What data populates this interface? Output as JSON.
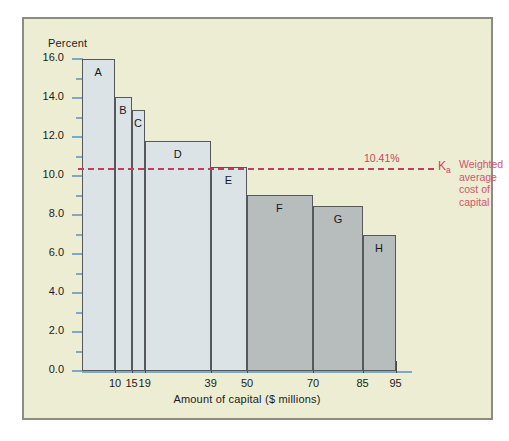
{
  "figure": {
    "y_axis_title": "Percent",
    "x_axis_title": "Amount of capital ($ millions)"
  },
  "annotation": {
    "value_label": "10.41%",
    "symbol": "K",
    "symbol_sub": "a",
    "description_lines": [
      "Weighted",
      "average",
      "cost of",
      "capital"
    ],
    "color": "#cf4263"
  },
  "colors": {
    "plate_background": "#ecedd2",
    "plate_border": "#8b8c84",
    "axis": "#7ea8c4",
    "bar_light": "#dbe3e6",
    "bar_dark": "#b7bcbd",
    "bar_outline": "#55595b",
    "wacc_line": "#c8395c",
    "text": "#1c1c1c"
  },
  "chart_data": {
    "type": "bar",
    "title": "",
    "xlabel": "Amount of capital ($ millions)",
    "ylabel": "Percent",
    "xlim": [
      0,
      100
    ],
    "ylim": [
      0.0,
      16.0
    ],
    "grid": false,
    "legend": "none",
    "ytick_labels": [
      "0.0",
      "2.0",
      "4.0",
      "6.0",
      "8.0",
      "10.0",
      "12.0",
      "14.0",
      "16.0"
    ],
    "ytick_values": [
      0.0,
      2.0,
      4.0,
      6.0,
      8.0,
      10.0,
      12.0,
      14.0,
      16.0
    ],
    "yminor_values": [
      1.0,
      3.0,
      5.0,
      7.0,
      9.0,
      11.0,
      13.0,
      15.0
    ],
    "xtick_labels": [
      "10",
      "15",
      "19",
      "39",
      "50",
      "70",
      "85",
      "95"
    ],
    "xtick_values": [
      10,
      15,
      19,
      39,
      50,
      70,
      85,
      95
    ],
    "categories": [
      "A",
      "B",
      "C",
      "D",
      "E",
      "F",
      "G",
      "H"
    ],
    "values": [
      16.0,
      14.05,
      13.4,
      11.8,
      10.45,
      9.05,
      8.45,
      7.0
    ],
    "bar_edges": [
      {
        "label": "A",
        "x_start": 0,
        "x_end": 10,
        "value": 16.0,
        "shade": "light"
      },
      {
        "label": "B",
        "x_start": 10,
        "x_end": 15,
        "value": 14.05,
        "shade": "light"
      },
      {
        "label": "C",
        "x_start": 15,
        "x_end": 19,
        "value": 13.4,
        "shade": "light"
      },
      {
        "label": "D",
        "x_start": 19,
        "x_end": 39,
        "value": 11.8,
        "shade": "light"
      },
      {
        "label": "E",
        "x_start": 39,
        "x_end": 50,
        "value": 10.45,
        "shade": "light"
      },
      {
        "label": "F",
        "x_start": 50,
        "x_end": 70,
        "value": 9.05,
        "shade": "dark"
      },
      {
        "label": "G",
        "x_start": 70,
        "x_end": 85,
        "value": 8.45,
        "shade": "dark"
      },
      {
        "label": "H",
        "x_start": 85,
        "x_end": 95,
        "value": 7.0,
        "shade": "dark"
      }
    ],
    "reference_line": {
      "value": 10.41,
      "label": "10.41%",
      "style": "dashed",
      "color": "#c8395c",
      "name": "Weighted average cost of capital"
    }
  }
}
